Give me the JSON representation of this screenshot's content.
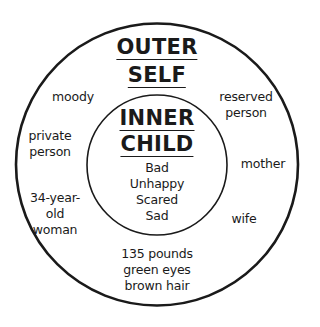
{
  "outer": {
    "title_line1": "OUTER",
    "title_line2": "SELF",
    "traits": [
      {
        "lines": [
          "moody"
        ]
      },
      {
        "lines": [
          "reserved",
          "person"
        ]
      },
      {
        "lines": [
          "private",
          "person"
        ]
      },
      {
        "lines": [
          "mother"
        ]
      },
      {
        "lines": [
          "34-year-",
          "old",
          "woman"
        ]
      },
      {
        "lines": [
          "wife"
        ]
      },
      {
        "lines": [
          "135 pounds",
          "green eyes",
          "brown hair"
        ]
      }
    ]
  },
  "inner": {
    "title_line1": "INNER",
    "title_line2": "CHILD",
    "feelings": [
      "Bad",
      "Unhappy",
      "Scared",
      "Sad"
    ]
  },
  "colors": {
    "ink": "#1a1a1a",
    "background": "#ffffff"
  }
}
